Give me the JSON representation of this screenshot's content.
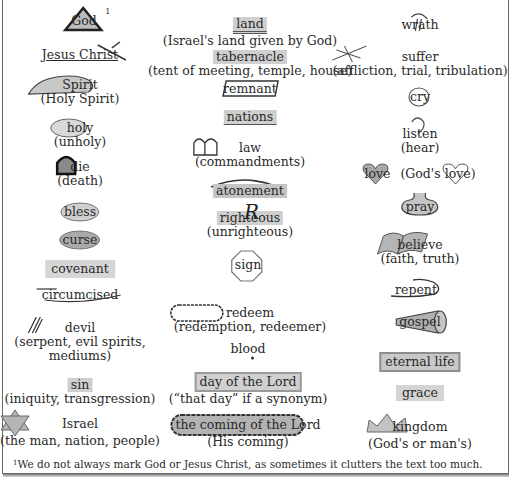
{
  "footnote": {
    "marker": "1",
    "text": "We do not always mark God or Jesus Christ, as sometimes it clutters the text too much."
  },
  "columns": {
    "left": [
      {
        "word": "God",
        "sup": "1",
        "symbol": "triangle"
      },
      {
        "word": "Jesus Christ",
        "symbol": "underline-cross"
      },
      {
        "word": "Spirit",
        "sub": "(Holy Spirit)",
        "symbol": "cloud-shape"
      },
      {
        "word": "holy",
        "sub": "(unholy)",
        "symbol": "cloud"
      },
      {
        "word": "die",
        "sub": "(death)",
        "symbol": "tombstone"
      },
      {
        "word": "bless",
        "symbol": "cloud"
      },
      {
        "word": "curse",
        "symbol": "cloud-dark"
      },
      {
        "word": "covenant",
        "symbol": "highlight"
      },
      {
        "word": "circumcised",
        "symbol": "cut-underline"
      },
      {
        "word": "devil",
        "sub": "(serpent, evil spirits,",
        "sub2": "mediums)",
        "symbol": "pitchfork"
      },
      {
        "word": "sin",
        "sub": "(iniquity, transgression)",
        "symbol": "highlight"
      },
      {
        "word": "Israel",
        "sub": "(the man, nation, people)",
        "symbol": "star-of-david"
      }
    ],
    "middle": [
      {
        "word": "land",
        "sub": "(Israel's land given by God)",
        "symbol": "highlight-double-underline"
      },
      {
        "word": "tabernacle",
        "sub": "(tent of meeting, temple, house)",
        "symbol": "highlight"
      },
      {
        "word": "remnant",
        "symbol": "box-slanted"
      },
      {
        "word": "nations",
        "symbol": "highlight-underline"
      },
      {
        "word": "law",
        "sub": "(commandments)",
        "symbol": "tablets"
      },
      {
        "word": "atonement",
        "symbol": "arc-highlight"
      },
      {
        "word": "righteous",
        "sub": "(unrighteous)",
        "symbol": "R-overlay"
      },
      {
        "word": "sign",
        "symbol": "octagon"
      },
      {
        "word": "redeem",
        "sub": "(redemption, redeemer)",
        "symbol": "scalloped-box"
      },
      {
        "word": "blood",
        "symbol": "drop"
      },
      {
        "word": "day of the Lord",
        "sub": "(“that day” if a synonym)",
        "symbol": "boxed-highlight"
      },
      {
        "word": "the coming of the Lord",
        "sub": "(His coming)",
        "symbol": "cloud-dark"
      }
    ],
    "right": [
      {
        "word": "wrath",
        "symbol": "lightning"
      },
      {
        "word": "suffer",
        "sub": "(affliction, trial, tribulation)",
        "symbol": "crown-of-thorns"
      },
      {
        "word": "cry",
        "symbol": "tear-circle"
      },
      {
        "word": "listen",
        "sub": "(hear)",
        "symbol": "ear"
      },
      {
        "word": "love",
        "pre_sub": "(God's",
        "word2": "love",
        "post_sub": ")",
        "symbol": "heart"
      },
      {
        "word": "pray",
        "symbol": "pot"
      },
      {
        "word": "believe",
        "sub": "(faith, truth)",
        "symbol": "book"
      },
      {
        "word": "repent",
        "symbol": "turn-arrow"
      },
      {
        "word": "gospel",
        "symbol": "megaphone"
      },
      {
        "word": "eternal life",
        "symbol": "boxed-highlight"
      },
      {
        "word": "grace",
        "symbol": "highlight"
      },
      {
        "word": "kingdom",
        "sub": "(God's or man's)",
        "symbol": "crown"
      }
    ]
  }
}
